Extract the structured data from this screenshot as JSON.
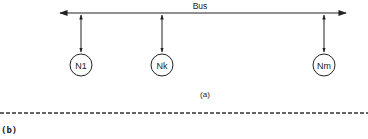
{
  "diagram": {
    "bus": {
      "label": "Bus",
      "direction": "bidirectional"
    },
    "nodes": [
      {
        "id": "n1",
        "label": "N1"
      },
      {
        "id": "nk",
        "label": "Nk"
      },
      {
        "id": "nm",
        "label": "Nm"
      }
    ],
    "connections": "bidirectional node-to-bus links",
    "part_a_label": "(a)",
    "part_b_label": "(b)",
    "separator": "dashed-line",
    "colors": {
      "ink": "#222222",
      "background": "#ffffff"
    }
  }
}
